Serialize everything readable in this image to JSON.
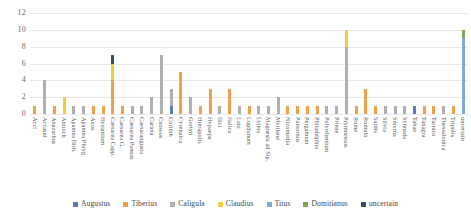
{
  "chart_data": {
    "type": "bar",
    "stacked": true,
    "title": "",
    "xlabel": "",
    "ylabel": "",
    "ylim": [
      0,
      12
    ],
    "yticks": [
      0,
      2,
      4,
      6,
      8,
      10,
      12
    ],
    "grid": true,
    "legend_position": "bottom",
    "series": [
      {
        "name": "Augustus",
        "color": "#5b7cb4"
      },
      {
        "name": "Tiberius",
        "color": "#eda14b"
      },
      {
        "name": "Caligula",
        "color": "#b0b0b0"
      },
      {
        "name": "Claudius",
        "color": "#f6cb3e"
      },
      {
        "name": "Titus",
        "color": "#82a9d9"
      },
      {
        "name": "Domitianus",
        "color": "#86a44f"
      },
      {
        "name": "uncertain",
        "color": "#3e4a6b"
      }
    ],
    "categories": [
      "Acci",
      "Accasni",
      "Anazarbus",
      "Antioch",
      "Apamea Bith.",
      "Apamea Phryg.",
      "Axos",
      "Byzantium",
      "Caesarea Capp.",
      "Caesarea G.",
      "Caesarea Paneas",
      "Caesaraugusta",
      "Carteia",
      "Cnossos",
      "Corinth",
      "Cyrenaica",
      "Gortyn",
      "Hierapolis",
      "Hypaepa",
      "Ilici",
      "Italica",
      "Lato",
      "Lugdunum",
      "Lyttos",
      "Magnesia ad Sip.",
      "Mytilene",
      "Nicomedia",
      "Panormus",
      "Pergamum",
      "Philadelphia",
      "Polyrrhenium",
      "Priene",
      "Prymnessus",
      "Rome",
      "Romula",
      "Sardis",
      "Silvia",
      "Smyrna",
      "Synnada",
      "Tabae",
      "Tanagra",
      "Tarraco",
      "Thessalonica",
      "Tripolis",
      "uncertain"
    ],
    "values": [
      {
        "Tiberius": 1
      },
      {
        "Caligula": 4
      },
      {
        "Tiberius": 1
      },
      {
        "Claudius": 2
      },
      {
        "Caligula": 1
      },
      {
        "Caligula": 1
      },
      {
        "Tiberius": 1
      },
      {
        "Tiberius": 1
      },
      {
        "Tiberius": 4,
        "Claudius": 2,
        "uncertain": 1
      },
      {
        "Tiberius": 1
      },
      {
        "Caligula": 1
      },
      {
        "Caligula": 1
      },
      {
        "Caligula": 2
      },
      {
        "Caligula": 7
      },
      {
        "Augustus": 1,
        "Caligula": 2
      },
      {
        "Tiberius": 5
      },
      {
        "Caligula": 2
      },
      {
        "Tiberius": 1
      },
      {
        "Tiberius": 3
      },
      {
        "Caligula": 1
      },
      {
        "Tiberius": 3
      },
      {
        "Caligula": 1
      },
      {
        "Tiberius": 1
      },
      {
        "Caligula": 1
      },
      {
        "Caligula": 1
      },
      {
        "Caligula": 2
      },
      {
        "Tiberius": 1
      },
      {
        "Tiberius": 1
      },
      {
        "Tiberius": 1
      },
      {
        "Tiberius": 1
      },
      {
        "Caligula": 1
      },
      {
        "Caligula": 1
      },
      {
        "Caligula": 8,
        "Claudius": 2
      },
      {
        "Tiberius": 1
      },
      {
        "Tiberius": 3
      },
      {
        "Tiberius": 1
      },
      {
        "Caligula": 1
      },
      {
        "Caligula": 1
      },
      {
        "Caligula": 1
      },
      {
        "Augustus": 1
      },
      {
        "Tiberius": 1
      },
      {
        "Tiberius": 1
      },
      {
        "Caligula": 1
      },
      {
        "Tiberius": 1
      },
      {
        "Titus": 9,
        "Domitianus": 1
      }
    ]
  }
}
